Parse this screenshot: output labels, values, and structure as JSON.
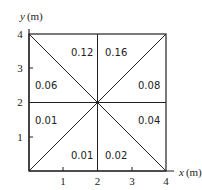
{
  "axes": {
    "x_label_var": "x",
    "x_label_unit": "(m)",
    "y_label_var": "y",
    "y_label_unit": "(m)",
    "x_ticks": [
      "1",
      "2",
      "3",
      "4"
    ],
    "y_ticks": [
      "1",
      "2",
      "3",
      "4"
    ]
  },
  "regions": [
    {
      "id": "top-left-upper",
      "value": "0.12"
    },
    {
      "id": "top-right-upper",
      "value": "0.16"
    },
    {
      "id": "left-upper",
      "value": "0.06"
    },
    {
      "id": "right-upper",
      "value": "0.08"
    },
    {
      "id": "left-lower",
      "value": "0.01"
    },
    {
      "id": "right-lower",
      "value": "0.04"
    },
    {
      "id": "bottom-left",
      "value": "0.01"
    },
    {
      "id": "bottom-right",
      "value": "0.02"
    }
  ],
  "colors": {
    "line": "#222222",
    "background": "#ffffff"
  }
}
